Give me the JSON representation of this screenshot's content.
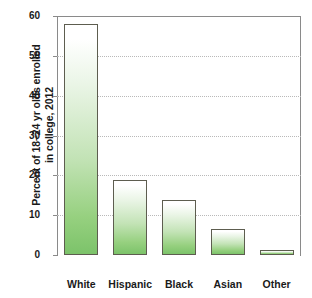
{
  "chart_data": {
    "type": "bar",
    "title": "",
    "xlabel": "",
    "ylabel": "Percent of 18–24 yr olds enrolled in college, 2012",
    "ylabel_lines": [
      "Percent of 18–24 yr olds enrolled",
      "in college, 2012"
    ],
    "categories": [
      "White",
      "Hispanic",
      "Black",
      "Asian",
      "Other"
    ],
    "values": [
      58,
      18.8,
      13.7,
      6.5,
      1.2
    ],
    "ylim": [
      0,
      60
    ],
    "yticks": [
      0,
      10,
      20,
      30,
      40,
      50,
      60
    ],
    "ytick_labels": [
      "0",
      "10",
      "20",
      "30",
      "40",
      "50",
      "60"
    ],
    "grid": true,
    "grid_orientation": "horizontal",
    "legend": "none",
    "bar_fill_top_color": "#ffffff",
    "bar_fill_bottom_color": "#7cc36a",
    "bar_border_color": "#5d5d4f",
    "gridline_color": "#b9b9b9",
    "axis_color": "#8a8a8a",
    "text_color": "#1a1a1a"
  }
}
